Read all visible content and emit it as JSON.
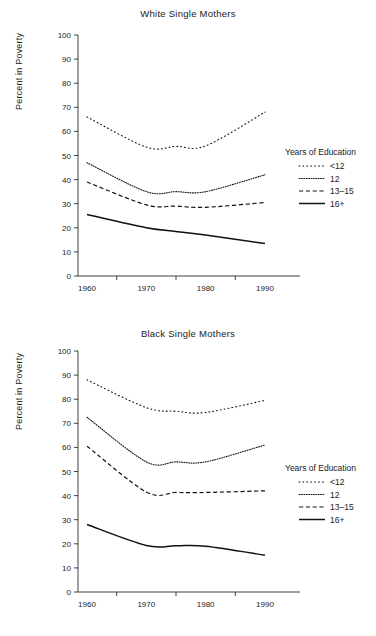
{
  "axis": {
    "ylabel": "Percent in Poverty",
    "yticks": [
      0,
      10,
      20,
      30,
      40,
      50,
      60,
      70,
      80,
      90,
      100
    ],
    "xticks": [
      "1960",
      "1970",
      "1980",
      "1990"
    ],
    "ylim": [
      0,
      100
    ]
  },
  "legend": {
    "title": "Years of Education",
    "entries": [
      {
        "label": "<12",
        "style": "dotted-wide"
      },
      {
        "label": "12",
        "style": "dotted-fine"
      },
      {
        "label": "13–15",
        "style": "dashed"
      },
      {
        "label": "16+",
        "style": "solid"
      }
    ]
  },
  "chart_data": [
    {
      "type": "line",
      "title": "White Single Mothers",
      "xlabel": "",
      "ylabel": "Percent in Poverty",
      "ylim": [
        0,
        100
      ],
      "grid": false,
      "legend_position": "right",
      "x": [
        1960,
        1970,
        1975,
        1980,
        1990
      ],
      "categories": [
        "1960",
        "1970",
        "1980",
        "1990"
      ],
      "series": [
        {
          "name": "<12",
          "dash": "dotted-wide",
          "values": [
            66.0,
            53.5,
            53.8,
            54.0,
            68.0
          ]
        },
        {
          "name": "12",
          "dash": "dotted-fine",
          "values": [
            47.0,
            35.0,
            35.0,
            35.0,
            42.0
          ]
        },
        {
          "name": "13-15",
          "dash": "dashed",
          "values": [
            39.0,
            29.5,
            29.0,
            28.5,
            30.5
          ]
        },
        {
          "name": "16+",
          "dash": "solid",
          "values": [
            25.5,
            20.0,
            18.5,
            17.0,
            13.5
          ]
        }
      ]
    },
    {
      "type": "line",
      "title": "Black Single Mothers",
      "xlabel": "",
      "ylabel": "Percent in Poverty",
      "ylim": [
        0,
        100
      ],
      "grid": false,
      "legend_position": "right",
      "x": [
        1960,
        1970,
        1975,
        1980,
        1990
      ],
      "categories": [
        "1960",
        "1970",
        "1980",
        "1990"
      ],
      "series": [
        {
          "name": "<12",
          "dash": "dotted-wide",
          "values": [
            88.0,
            76.5,
            75.0,
            74.5,
            79.5
          ]
        },
        {
          "name": "12",
          "dash": "dotted-fine",
          "values": [
            72.5,
            54.0,
            54.0,
            54.0,
            61.0
          ]
        },
        {
          "name": "13-15",
          "dash": "dashed",
          "values": [
            60.5,
            41.5,
            41.3,
            41.3,
            42.0
          ]
        },
        {
          "name": "16+",
          "dash": "solid",
          "values": [
            28.0,
            19.3,
            19.2,
            19.0,
            15.3
          ]
        }
      ]
    }
  ]
}
